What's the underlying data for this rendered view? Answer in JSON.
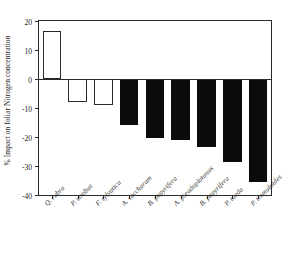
{
  "chart_data": {
    "type": "bar",
    "title": "",
    "subtitle": "",
    "xlabel": "",
    "ylabel": "% Impact on foliar Nitrogen concentration",
    "ylim": [
      -40,
      20
    ],
    "yticks": [
      20,
      10,
      0,
      -10,
      -20,
      -30,
      -40
    ],
    "ytick_labels": [
      "20",
      "10",
      "0",
      "-10",
      "-20",
      "-30",
      "-40"
    ],
    "grid": false,
    "legend": null,
    "zero_line": 0,
    "categories": [
      "Q. rubra",
      "P. strobus",
      "F. sylvatica",
      "A. saccharum",
      "B. papyrifera",
      "A. pseudoplatanus",
      "B. papyrifera",
      "P. taeda",
      "P. tremuloides"
    ],
    "values": [
      16.5,
      -8.0,
      -9.0,
      -16.0,
      -20.5,
      -21.0,
      -23.5,
      -28.5,
      -35.5
    ],
    "bar_styles": [
      "hollow",
      "hollow",
      "hollow",
      "filled",
      "filled",
      "filled",
      "filled",
      "filled",
      "filled"
    ],
    "colors": {
      "filled": "#0b0b0b",
      "hollow": "#ffffff",
      "outline": "#2a2a2a",
      "background": "#ffffff",
      "text": "#242424"
    }
  }
}
